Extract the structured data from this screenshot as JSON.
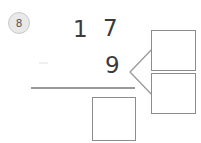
{
  "worksheet": {
    "problem_number": "8",
    "type": "vertical-arithmetic-with-decomposition",
    "problem": {
      "top_number": {
        "value": "17",
        "tens_digit": "1",
        "ones_digit": "7"
      },
      "bottom_number": {
        "value": "9",
        "ones_digit": "9"
      },
      "answer_box_value": "",
      "answer_box_placeholder": ""
    },
    "decomposition": {
      "bracket_icon": "less-than-bracket-icon",
      "source_digit": "9",
      "parts": [
        {
          "value": "",
          "placeholder": ""
        },
        {
          "value": "",
          "placeholder": ""
        }
      ]
    },
    "colors": {
      "ink": "#3b3b3b",
      "rule": "#9a9a9a",
      "box_border": "#8d8d8d",
      "badge_fill": "#e9e9e9",
      "badge_text": "#4a4a4a",
      "page_background": "#ffffff"
    }
  }
}
